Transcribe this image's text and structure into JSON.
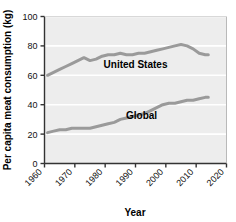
{
  "chart_data": {
    "type": "line",
    "title": "",
    "xlabel": "Year",
    "ylabel": "Per capita meat consumption (kg)",
    "xlim": [
      1960,
      2020
    ],
    "ylim": [
      0,
      100
    ],
    "xticks": [
      1960,
      1970,
      1980,
      1990,
      2000,
      2010,
      2020
    ],
    "xticklabels": [
      "1960",
      "1970",
      "1980",
      "1990",
      "2000",
      "2010",
      "2020"
    ],
    "yticks": [
      0,
      20,
      40,
      60,
      80,
      100
    ],
    "yticklabels": [
      "0",
      "20",
      "40",
      "60",
      "80",
      "100"
    ],
    "grid": "horizontal-white-on-gray",
    "legend": "inline-labels",
    "plot_bgcolor": "#ededed",
    "gridline_color": "#ffffff",
    "line_color": "#9a9a9a",
    "axis_color": "#333333",
    "series": [
      {
        "name": "United States",
        "label_x": 1990,
        "label_y": 65,
        "x": [
          1961,
          1963,
          1965,
          1967,
          1969,
          1971,
          1973,
          1975,
          1977,
          1979,
          1981,
          1983,
          1985,
          1987,
          1989,
          1991,
          1993,
          1995,
          1997,
          1999,
          2001,
          2003,
          2005,
          2007,
          2009,
          2011,
          2013,
          2014
        ],
        "values": [
          60,
          62,
          64,
          66,
          68,
          70,
          72,
          70,
          71,
          73,
          74,
          74,
          75,
          74,
          74,
          75,
          75,
          76,
          77,
          78,
          79,
          80,
          81,
          80,
          78,
          75,
          74,
          74
        ]
      },
      {
        "name": "Global",
        "label_x": 1992,
        "label_y": 30,
        "x": [
          1961,
          1963,
          1965,
          1967,
          1969,
          1971,
          1973,
          1975,
          1977,
          1979,
          1981,
          1983,
          1985,
          1987,
          1989,
          1991,
          1993,
          1995,
          1997,
          1999,
          2001,
          2003,
          2005,
          2007,
          2009,
          2011,
          2013,
          2014
        ],
        "values": [
          21,
          22,
          23,
          23,
          24,
          24,
          24,
          24,
          25,
          26,
          27,
          28,
          30,
          31,
          32,
          33,
          34,
          36,
          38,
          40,
          41,
          41,
          42,
          43,
          43,
          44,
          45,
          45
        ]
      }
    ]
  }
}
